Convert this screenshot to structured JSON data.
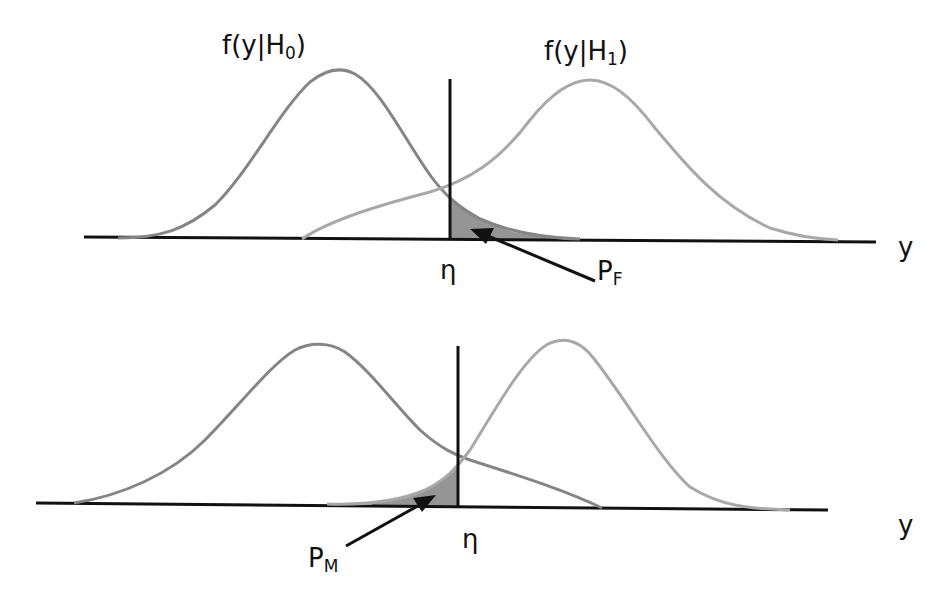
{
  "diagram": {
    "top_panel": {
      "h0_label": {
        "base": "f(y|H",
        "sub": "0",
        "close": ")"
      },
      "h1_label": {
        "base": "f(y|H",
        "sub": "1",
        "close": ")"
      },
      "threshold_label": "η",
      "axis_label": "y",
      "shaded_label": {
        "base": "P",
        "sub": "F"
      },
      "shaded_meaning": "false alarm probability (area of H0 right of threshold)"
    },
    "bottom_panel": {
      "threshold_label": "η",
      "axis_label": "y",
      "shaded_label": {
        "base": "P",
        "sub": "M"
      },
      "shaded_meaning": "miss probability (area of H1 left of threshold)"
    },
    "colors": {
      "axis": "#111111",
      "h0_curve": "#858585",
      "h1_curve": "#a8a8a8",
      "shade": "#8a8a8a",
      "text": "#111111"
    }
  }
}
